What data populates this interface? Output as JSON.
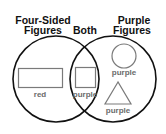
{
  "diagram": {
    "type": "venn",
    "sets": {
      "left": {
        "title_line1": "Four-Sided",
        "title_line2": "Figures"
      },
      "intersection": {
        "title": "Both"
      },
      "right": {
        "title_line1": "Purple",
        "title_line2": "Figures"
      }
    },
    "items": [
      {
        "region": "left",
        "shape": "rectangle",
        "label": "red"
      },
      {
        "region": "intersection",
        "shape": "square",
        "label": "purple"
      },
      {
        "region": "right",
        "shape": "circle",
        "label": "purple"
      },
      {
        "region": "right",
        "shape": "triangle",
        "label": "purple"
      }
    ],
    "colors": {
      "background": "#ffffff",
      "circle_stroke": "#111111",
      "shape_stroke": "#7a7a7a",
      "heading_text": "#111111",
      "label_text": "#6b6b6b"
    }
  }
}
